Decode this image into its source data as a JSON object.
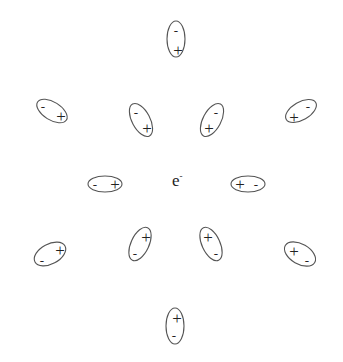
{
  "diagram": {
    "center_label": {
      "base": "e",
      "superscript": "-",
      "x": 172,
      "y": 186
    },
    "colors": {
      "outline": "#555555",
      "text": "#222222",
      "background": "#ffffff"
    },
    "dipoles": [
      {
        "id": "top",
        "cx": 176,
        "cy": 39,
        "rx": 9,
        "ry": 18,
        "rotate": 0,
        "neg": {
          "x": 176,
          "y": 30
        },
        "pos": {
          "x": 178,
          "y": 50
        }
      },
      {
        "id": "upper-outer-left",
        "cx": 52,
        "cy": 111,
        "rx": 17,
        "ry": 9,
        "rotate": 32,
        "neg": {
          "x": 43,
          "y": 106
        },
        "pos": {
          "x": 61,
          "y": 116
        }
      },
      {
        "id": "upper-inner-left",
        "cx": 141,
        "cy": 120,
        "rx": 9,
        "ry": 18,
        "rotate": -28,
        "neg": {
          "x": 136,
          "y": 112
        },
        "pos": {
          "x": 147,
          "y": 128
        }
      },
      {
        "id": "upper-inner-right",
        "cx": 212,
        "cy": 120,
        "rx": 9,
        "ry": 18,
        "rotate": 28,
        "neg": {
          "x": 216,
          "y": 112
        },
        "pos": {
          "x": 209,
          "y": 128
        }
      },
      {
        "id": "upper-outer-right",
        "cx": 301,
        "cy": 111,
        "rx": 17,
        "ry": 9,
        "rotate": -30,
        "neg": {
          "x": 308,
          "y": 106
        },
        "pos": {
          "x": 294,
          "y": 117
        }
      },
      {
        "id": "middle-left",
        "cx": 105,
        "cy": 184,
        "rx": 17,
        "ry": 8,
        "rotate": 0,
        "neg": {
          "x": 95,
          "y": 184
        },
        "pos": {
          "x": 115,
          "y": 184
        }
      },
      {
        "id": "middle-right",
        "cx": 248,
        "cy": 184,
        "rx": 17,
        "ry": 8,
        "rotate": 0,
        "neg": {
          "x": 256,
          "y": 184
        },
        "pos": {
          "x": 240,
          "y": 184
        }
      },
      {
        "id": "lower-outer-left",
        "cx": 50,
        "cy": 254,
        "rx": 17,
        "ry": 10,
        "rotate": -28,
        "neg": {
          "x": 42,
          "y": 260
        },
        "pos": {
          "x": 60,
          "y": 250
        }
      },
      {
        "id": "lower-inner-left",
        "cx": 140,
        "cy": 244,
        "rx": 9,
        "ry": 18,
        "rotate": 25,
        "neg": {
          "x": 135,
          "y": 253
        },
        "pos": {
          "x": 146,
          "y": 237
        }
      },
      {
        "id": "lower-inner-right",
        "cx": 211,
        "cy": 244,
        "rx": 9,
        "ry": 18,
        "rotate": -25,
        "neg": {
          "x": 216,
          "y": 253
        },
        "pos": {
          "x": 208,
          "y": 237
        }
      },
      {
        "id": "lower-outer-right",
        "cx": 300,
        "cy": 254,
        "rx": 17,
        "ry": 10,
        "rotate": 30,
        "neg": {
          "x": 307,
          "y": 260
        },
        "pos": {
          "x": 294,
          "y": 251
        }
      },
      {
        "id": "bottom",
        "cx": 175,
        "cy": 326,
        "rx": 9,
        "ry": 18,
        "rotate": 0,
        "neg": {
          "x": 174,
          "y": 335
        },
        "pos": {
          "x": 177,
          "y": 318
        }
      }
    ],
    "signs": {
      "positive": "+",
      "negative": "-"
    }
  }
}
